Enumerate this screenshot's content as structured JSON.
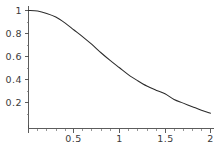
{
  "chart_data": {
    "type": "line",
    "title": "",
    "subtitle": "",
    "xlabel": "",
    "ylabel": "",
    "xlim": [
      0,
      2
    ],
    "ylim": [
      0,
      1.04
    ],
    "grid": false,
    "legend": false,
    "legend_position": "none",
    "line_color": "#2b2b2b",
    "axis_color": "#4a4a4a",
    "background_color": "#ffffff",
    "x_ticks": [
      {
        "value": 0.5,
        "label": "0.5"
      },
      {
        "value": 1,
        "label": "1"
      },
      {
        "value": 1.5,
        "label": "1.5"
      },
      {
        "value": 2,
        "label": "2"
      }
    ],
    "x_minor_ticks": [
      0.1,
      0.2,
      0.3,
      0.4,
      0.6,
      0.7,
      0.8,
      0.9,
      1.1,
      1.2,
      1.3,
      1.4,
      1.6,
      1.7,
      1.8,
      1.9
    ],
    "y_ticks": [
      {
        "value": 0.2,
        "label": "0.2"
      },
      {
        "value": 0.4,
        "label": "0.4"
      },
      {
        "value": 0.6,
        "label": "0.6"
      },
      {
        "value": 0.8,
        "label": "0.8"
      },
      {
        "value": 1.0,
        "label": "1"
      }
    ],
    "y_minor_ticks": [
      0.05,
      0.1,
      0.15,
      0.25,
      0.3,
      0.35,
      0.45,
      0.5,
      0.55,
      0.65,
      0.7,
      0.75,
      0.85,
      0.9,
      0.95
    ],
    "series": [
      {
        "name": "curve",
        "x": [
          0.0,
          0.1,
          0.2,
          0.3,
          0.4,
          0.5,
          0.6,
          0.7,
          0.8,
          0.9,
          1.0,
          1.1,
          1.2,
          1.3,
          1.4,
          1.5,
          1.6,
          1.7,
          1.8,
          1.9,
          2.0
        ],
        "y": [
          1.0,
          0.995,
          0.975,
          0.945,
          0.895,
          0.835,
          0.775,
          0.71,
          0.64,
          0.575,
          0.515,
          0.455,
          0.405,
          0.36,
          0.325,
          0.295,
          0.245,
          0.215,
          0.185,
          0.155,
          0.13
        ]
      }
    ]
  },
  "x_tick_labels": {
    "t0": "0.5",
    "t1": "1",
    "t2": "1.5",
    "t3": "2"
  },
  "y_tick_labels": {
    "t0": "0.2",
    "t1": "0.4",
    "t2": "0.6",
    "t3": "0.8",
    "t4": "1"
  }
}
